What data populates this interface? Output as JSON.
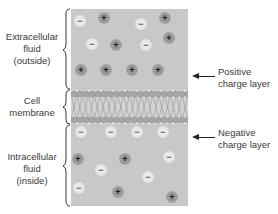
{
  "labels": {
    "extracellular": [
      "Extracellular",
      "fluid",
      "(outside)"
    ],
    "membrane": [
      "Cell",
      "membrane"
    ],
    "intracellular": [
      "Intracellular",
      "fluid",
      "(inside)"
    ],
    "positive_layer": [
      "Positive",
      "charge layer"
    ],
    "negative_layer": [
      "Negative",
      "charge layer"
    ]
  },
  "ions": {
    "outside": [
      {
        "x": 80,
        "y": 21,
        "sign": "−",
        "type": "neg"
      },
      {
        "x": 104,
        "y": 18,
        "sign": "+",
        "type": "pos"
      },
      {
        "x": 141,
        "y": 24,
        "sign": "−",
        "type": "neg"
      },
      {
        "x": 165,
        "y": 18,
        "sign": "+",
        "type": "pos"
      },
      {
        "x": 92,
        "y": 44,
        "sign": "−",
        "type": "neg"
      },
      {
        "x": 116,
        "y": 45,
        "sign": "+",
        "type": "pos"
      },
      {
        "x": 146,
        "y": 45,
        "sign": "−",
        "type": "neg"
      },
      {
        "x": 169,
        "y": 38,
        "sign": "+",
        "type": "pos"
      },
      {
        "x": 81,
        "y": 70,
        "sign": "+",
        "type": "pos"
      },
      {
        "x": 106,
        "y": 70,
        "sign": "+",
        "type": "pos"
      },
      {
        "x": 132,
        "y": 70,
        "sign": "+",
        "type": "pos"
      },
      {
        "x": 158,
        "y": 70,
        "sign": "+",
        "type": "pos"
      }
    ],
    "inside": [
      {
        "x": 81,
        "y": 132,
        "sign": "−",
        "type": "neg"
      },
      {
        "x": 111,
        "y": 132,
        "sign": "−",
        "type": "neg"
      },
      {
        "x": 137,
        "y": 132,
        "sign": "−",
        "type": "neg"
      },
      {
        "x": 163,
        "y": 132,
        "sign": "−",
        "type": "neg"
      },
      {
        "x": 78,
        "y": 159,
        "sign": "+",
        "type": "pos"
      },
      {
        "x": 125,
        "y": 159,
        "sign": "+",
        "type": "pos"
      },
      {
        "x": 169,
        "y": 157,
        "sign": "−",
        "type": "neg"
      },
      {
        "x": 101,
        "y": 170,
        "sign": "−",
        "type": "neg"
      },
      {
        "x": 148,
        "y": 177,
        "sign": "−",
        "type": "neg"
      },
      {
        "x": 79,
        "y": 188,
        "sign": "−",
        "type": "neg"
      },
      {
        "x": 118,
        "y": 192,
        "sign": "+",
        "type": "pos"
      },
      {
        "x": 172,
        "y": 197,
        "sign": "+",
        "type": "pos"
      }
    ]
  },
  "colors": {
    "fluid": "#c8c8c8",
    "positive_ion": "#9d9d9d",
    "negative_ion": "#e8e8e8",
    "membrane_head": "#a8a8a8"
  }
}
